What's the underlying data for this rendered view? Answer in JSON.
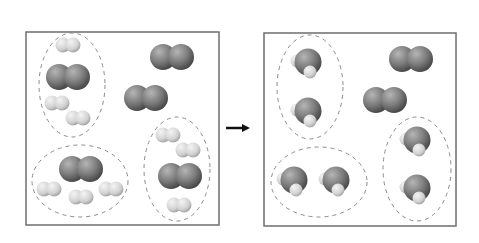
{
  "diagram": {
    "type": "chemical-reaction-particle-diagram",
    "colors": {
      "box_border": "#6e6e6e",
      "group_outline": "#8a8a8a",
      "oxygen_dark": "#5a5a5a",
      "oxygen_light": "#b5b5b5",
      "hydrogen_dark": "#b9b9b9",
      "hydrogen_light": "#f0f0f0",
      "arrow": "#111111"
    },
    "reactants_box": {
      "x": 26,
      "y": 32,
      "width": 193,
      "height": 193,
      "groups": [
        {
          "cx": 72,
          "cy": 85,
          "rx": 33,
          "ry": 52
        },
        {
          "cx": 80,
          "cy": 181,
          "rx": 48,
          "ry": 36
        },
        {
          "cx": 177,
          "cy": 169,
          "rx": 33,
          "ry": 52
        }
      ],
      "o2_molecules": [
        {
          "x": 68,
          "y": 77
        },
        {
          "x": 172,
          "y": 57
        },
        {
          "x": 146,
          "y": 98
        },
        {
          "x": 81,
          "y": 169
        },
        {
          "x": 180,
          "y": 176
        }
      ],
      "h2_molecules": [
        {
          "x": 68,
          "y": 45
        },
        {
          "x": 57,
          "y": 103
        },
        {
          "x": 78,
          "y": 118
        },
        {
          "x": 49,
          "y": 189
        },
        {
          "x": 81,
          "y": 197
        },
        {
          "x": 111,
          "y": 189
        },
        {
          "x": 168,
          "y": 135
        },
        {
          "x": 188,
          "y": 150
        },
        {
          "x": 179,
          "y": 205
        }
      ]
    },
    "products_box": {
      "x": 264,
      "y": 33,
      "width": 192,
      "height": 193,
      "groups": [
        {
          "cx": 310,
          "cy": 87,
          "rx": 33,
          "ry": 52
        },
        {
          "cx": 319,
          "cy": 182,
          "rx": 48,
          "ry": 35
        },
        {
          "cx": 417,
          "cy": 169,
          "rx": 34,
          "ry": 52
        }
      ],
      "o2_molecules": [
        {
          "x": 411,
          "y": 59
        },
        {
          "x": 385,
          "y": 100
        }
      ],
      "h2o_molecules": [
        {
          "x": 308,
          "y": 62
        },
        {
          "x": 308,
          "y": 111
        },
        {
          "x": 294,
          "y": 180
        },
        {
          "x": 336,
          "y": 180
        },
        {
          "x": 417,
          "y": 140
        },
        {
          "x": 417,
          "y": 188
        }
      ]
    },
    "arrow": {
      "x1": 226,
      "y1": 128,
      "x2": 252,
      "y2": 128
    },
    "legend_semantics": {
      "dark_large_pair": "O2 molecule",
      "light_small_pair": "H2 molecule",
      "dark_with_light": "H2O molecule"
    }
  }
}
